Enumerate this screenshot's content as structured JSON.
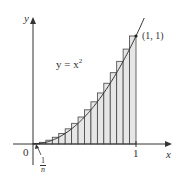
{
  "chart_data": {
    "type": "bar",
    "title": "",
    "function": "y = x^2",
    "n": 16,
    "rect_width_label": "1/n",
    "categories": [
      "1/16",
      "2/16",
      "3/16",
      "4/16",
      "5/16",
      "6/16",
      "7/16",
      "8/16",
      "9/16",
      "10/16",
      "11/16",
      "12/16",
      "13/16",
      "14/16",
      "15/16",
      "16/16"
    ],
    "values": [
      0.0039,
      0.0156,
      0.0352,
      0.0625,
      0.0977,
      0.1406,
      0.1914,
      0.25,
      0.3164,
      0.3906,
      0.4727,
      0.5625,
      0.6602,
      0.7656,
      0.8789,
      1.0
    ],
    "xlabel": "x",
    "ylabel": "y",
    "xlim": [
      0,
      1.08
    ],
    "ylim": [
      0,
      1.2
    ],
    "x_ticks": [
      "0",
      "1"
    ],
    "annotations": {
      "curve_label": "y = x",
      "curve_exponent": "2",
      "point_label": "(1, 1)",
      "origin_label": "0",
      "tick_one_label": "1",
      "width_numerator": "1",
      "width_denominator": "n"
    },
    "grid": false,
    "legend": "none",
    "colors": {
      "rect_fill": "#e6e6e6",
      "rect_stroke": "#444444",
      "curve": "#333333",
      "axis": "#333333"
    }
  }
}
